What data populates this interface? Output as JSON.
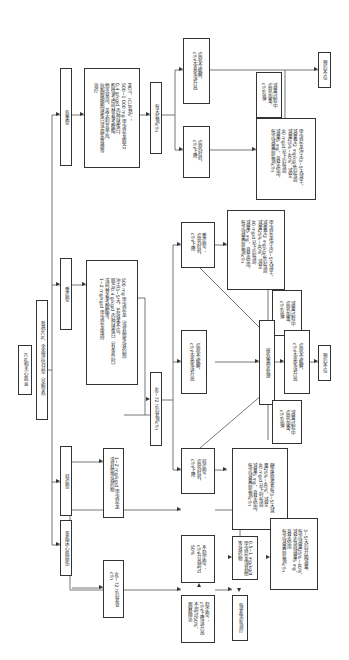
{
  "diagram": {
    "orientation": "rotated-90-clockwise",
    "root": {
      "label": "ICIs相关心肌炎"
    },
    "classification": {
      "label": "暂停ICIs，全面评估分型（见附表）"
    },
    "branches": {
      "critical": {
        "label": "危重型",
        "treatment": "MDT，ICU监护；\n500~1 000 mg 甲泼尼龙联合\n0.4 g/kg/d 丙种球蛋白，\n酌情考虑吗替麦考酚酯、\n他克莫司、英夫利昔单抗、\n抗胸腺细胞球蛋白或血浆置换等\n治疗",
        "monitor": "每天监测cTn",
        "improved": "症状好转，\ncTn下降",
        "not_improved": "症状不缓解，\ncTn无变化或升高",
        "taper": "甲泼尼龙冲击3~5天减半，\n减量至2 mg/kg/d后每周\n减量25%~40%，减至\n40 mg/d以下后每周\n减量5 mg，直至停用，\n每次减量前监测cTn",
        "taper_recurrence": "减量过程中\n症状加重，\ncTn反弹",
        "refer": "预后不佳"
      },
      "severe": {
        "label": "重症型",
        "treatment": "500 mg 甲泼尼龙（或其他等效药物）\n冲击3~5天，若效果不佳，\n联合0.4 g/kg/d 丙种球蛋白（有条件时）\n或吗替麦考酚酯等，\n1~2 mg/kg/d 甲泼尼龙维持",
        "monitor": "48~72 h后复测cTn"
      },
      "mild": {
        "label": "轻症型",
        "treatment": "1~2 mg/kg/d 甲泼尼龙\n或其他等效药物",
        "monitor": "48~72 h后复测cTn",
        "improved": "轻症型：\n症状好转，\ncTn下降",
        "not_improved": "症状不缓解，\ncTn无变化或升高",
        "taper": "糖皮质激素每3~5天减\n量25%~40%，减至\n40 mg/d以下时每周\n减量5 mg，直至停用，\n每次减量前监测cTn",
        "taper_recurrence": "减量过程中\n症状加重，\ncTn反弹"
      },
      "subclinical": {
        "label": "亚临床心肌损伤",
        "monitor": "48~72 h后复查\ncTn",
        "stable": "稳定型：\ncTn下降或升高\n不超过50%，\n观察随访",
        "unstable": "不稳定型：\ncTn升高超过\n50%",
        "unstable_treatment": "0.5~1 mg/kg/d\n甲泼尼龙或其他\n等效药物",
        "resume": "恢复免疫治疗",
        "unstable_taper": "3~5天后开始减量，\n每次减量25%~40%，\n减至每周减量5 mg，\n直至停用\n每次减量前监测cTn"
      },
      "escalation": {
        "severe_eval": "重症型：\n症状好转，\ncTn下降",
        "severe_not_improved": "症状不缓解，\ncTn无变化或升高",
        "upgrade": "按危重型处理",
        "severe_taper": "甲泼尼龙冲击3~5天减半，\n减量至2 mg/kg/d后每周\n减量25%~40%，减至\n40 mg/d以下后每周\n减量5 mg，直至停用，\n每次减量前监测cTn",
        "severe_recurrence": "减量过程中\n症状加重，\ncTn反弹",
        "poor_prognosis": "预后不佳"
      }
    }
  }
}
